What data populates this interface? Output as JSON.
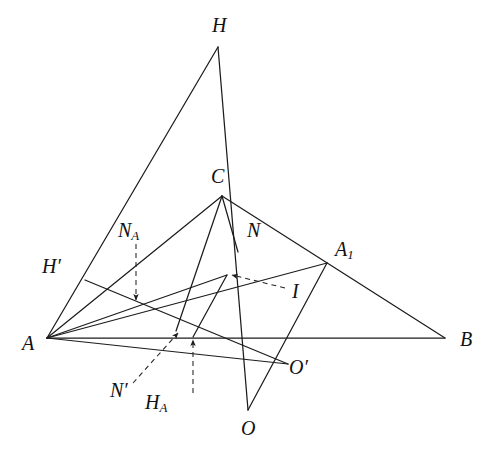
{
  "figure": {
    "width": 490,
    "height": 451,
    "background": "#ffffff",
    "stroke_color": "#1c1c1c",
    "dash_color": "#222222"
  },
  "points": {
    "A": {
      "label": "A",
      "x": 47,
      "y": 338,
      "lx": 22,
      "ly": 345
    },
    "B": {
      "label": "B",
      "x": 445,
      "y": 338,
      "lx": 460,
      "ly": 341
    },
    "C": {
      "label": "C",
      "x": 222,
      "y": 196,
      "lx": 211,
      "ly": 178
    },
    "H": {
      "label": "H",
      "x": 218,
      "y": 47,
      "lx": 212,
      "ly": 27
    },
    "O": {
      "label": "O",
      "x": 248,
      "y": 410,
      "lx": 241,
      "ly": 430
    },
    "N": {
      "label": "N",
      "x": 238,
      "y": 252,
      "lx": 247,
      "ly": 232
    },
    "I": {
      "label": "I",
      "x": 227,
      "y": 275,
      "lx": 292,
      "ly": 293
    },
    "A1": {
      "label": "A",
      "sub": "1",
      "x": 327,
      "y": 263,
      "lx": 335,
      "ly": 251
    },
    "Hp": {
      "label": "H",
      "prime": true,
      "x": 85,
      "y": 280,
      "lx": 42,
      "ly": 268
    },
    "Op": {
      "label": "O",
      "prime": true,
      "x": 288,
      "y": 364,
      "lx": 289,
      "ly": 369
    },
    "NA": {
      "label": "N",
      "sub": "A",
      "x": 136,
      "y": 303,
      "lx": 118,
      "ly": 232
    },
    "Np": {
      "label": "N",
      "prime": true,
      "x": 176,
      "y": 331,
      "lx": 110,
      "ly": 392
    },
    "HA": {
      "label": "H",
      "sub": "A",
      "x": 193,
      "y": 337,
      "lx": 145,
      "ly": 404
    }
  },
  "segments": [
    {
      "name": "side-AB",
      "from": "A",
      "to": "B"
    },
    {
      "name": "side-CA",
      "from": "C",
      "to": "A"
    },
    {
      "name": "side-CB",
      "from": "C",
      "to": "B"
    },
    {
      "name": "altitude-A-to-H",
      "from": "A",
      "to": "H"
    },
    {
      "name": "line-H-to-O",
      "from": "H",
      "to": "O"
    },
    {
      "name": "line-A-to-A1",
      "from": "A",
      "to": "A1"
    },
    {
      "name": "line-A1-to-O",
      "from": "A1",
      "to": "O"
    },
    {
      "name": "line-A-to-Op",
      "from": "A",
      "to": "Op"
    },
    {
      "name": "line-Hp-to-Op",
      "from": "Hp",
      "to": "Op"
    },
    {
      "name": "line-C-to-Np",
      "from": "C",
      "to": "Np"
    },
    {
      "name": "line-I-to-HA",
      "from": "I",
      "to": "HA"
    },
    {
      "name": "line-I-to-A",
      "from": "I",
      "to": "A"
    },
    {
      "name": "line-C-to-N",
      "from": "C",
      "to": "N"
    }
  ],
  "arrows": [
    {
      "name": "arrow-NA",
      "from_x": 136,
      "from_y": 244,
      "to_x": 136,
      "to_y": 300
    },
    {
      "name": "arrow-I",
      "from_x": 285,
      "from_y": 288,
      "to_x": 232,
      "to_y": 275
    },
    {
      "name": "arrow-Np",
      "from_x": 133,
      "from_y": 383,
      "to_x": 178,
      "to_y": 333
    },
    {
      "name": "arrow-HA",
      "from_x": 193,
      "from_y": 393,
      "to_x": 193,
      "to_y": 340
    }
  ],
  "labels_order": [
    "H",
    "C",
    "N",
    "A1",
    "NA",
    "Hp",
    "I",
    "A",
    "B",
    "Op",
    "Np",
    "HA",
    "O"
  ]
}
